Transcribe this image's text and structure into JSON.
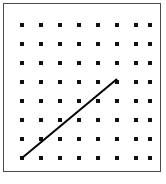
{
  "figure": {
    "name": "dot-lattice-with-line-segment",
    "canvas": {
      "width": 166,
      "height": 184,
      "background": "#ffffff"
    },
    "frame": {
      "label": "border-rectangle",
      "x": 3,
      "y": 3,
      "width": 158,
      "height": 169,
      "stroke_color": "#4a4a4a",
      "stroke_width": 1.5,
      "fill": "#ffffff"
    }
  },
  "chart_data": {
    "type": "scatter",
    "title": "",
    "subtitle": "",
    "xlabel": "",
    "ylabel": "",
    "grid": false,
    "legend": null,
    "annotations": [],
    "lattice": {
      "rows": 8,
      "columns": 8,
      "dot_color": "#111111",
      "dot_size": 3.2,
      "dot_shape": "square",
      "x_positions": [
        22,
        41,
        60,
        79,
        98,
        117,
        136,
        150
      ],
      "y_positions": [
        25,
        44,
        63,
        82,
        101,
        120,
        139,
        158
      ],
      "column_spacing": 19,
      "row_spacing": 19
    },
    "segments": [
      {
        "name": "diagonal-line-segment",
        "x1": 22,
        "y1": 158,
        "x2": 117,
        "y2": 79,
        "start_grid_point": {
          "column": 1,
          "row": 8
        },
        "end_grid_point": {
          "column": 6,
          "row": 4
        },
        "run_columns": 5,
        "rise_rows": 4,
        "slope": 0.8,
        "stroke_color": "#000000",
        "stroke_width": 2
      }
    ],
    "tick_labels": {
      "x": [],
      "y": []
    },
    "xlim": [
      0,
      166
    ],
    "ylim": [
      0,
      184
    ]
  }
}
